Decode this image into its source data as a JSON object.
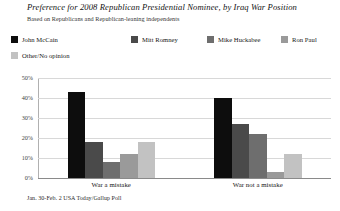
{
  "chart_data": {
    "type": "bar",
    "title": "Preference for 2008 Republican Presidential Nominee, by Iraq War Position",
    "subtitle": "Based on Republicans and Republican-leaning independents",
    "source": "Jan. 30-Feb. 2 USA Today/Gallup Poll",
    "xlabel": "",
    "ylabel": "",
    "ylim": [
      0,
      50
    ],
    "grid": true,
    "legend_position": "top",
    "categories": [
      "War a mistake",
      "War not a mistake"
    ],
    "ytick_labels": [
      "50%",
      "40%",
      "30%",
      "20%",
      "10%",
      "0%"
    ],
    "ytick_values": [
      50,
      40,
      30,
      20,
      10,
      0
    ],
    "series": [
      {
        "name": "John McCain",
        "color": "#0d0d0d",
        "values": [
          43,
          40
        ]
      },
      {
        "name": "Mitt Romney",
        "color": "#4a4a4a",
        "values": [
          18,
          27
        ]
      },
      {
        "name": "Mike Huckabee",
        "color": "#6e6e6e",
        "values": [
          8,
          22
        ]
      },
      {
        "name": "Ron Paul",
        "color": "#9a9a9a",
        "values": [
          12,
          3
        ]
      },
      {
        "name": "Other/No opinion",
        "color": "#c2c2c2",
        "values": [
          18,
          12
        ]
      }
    ]
  },
  "legend_layout": [
    {
      "left": 0,
      "top": 0
    },
    {
      "left": 120,
      "top": 0
    },
    {
      "left": 196,
      "top": 0
    },
    {
      "left": 270,
      "top": 0
    },
    {
      "left": 0,
      "top": 16
    }
  ]
}
